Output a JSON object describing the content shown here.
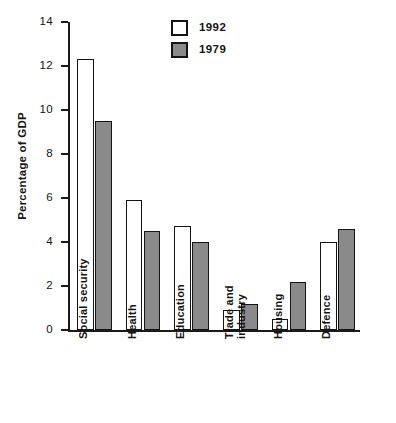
{
  "chart_data": {
    "type": "bar",
    "title": "",
    "xlabel": "",
    "ylabel": "Percentage of GDP",
    "ylim": [
      0,
      14
    ],
    "ytick_labels": [
      "0",
      "2",
      "4",
      "6",
      "8",
      "10",
      "12",
      "14"
    ],
    "ytick_values": [
      0,
      2,
      4,
      6,
      8,
      10,
      12,
      14
    ],
    "grid": false,
    "legend_position": "top-center",
    "categories": [
      "Social security",
      "Health",
      "Education",
      "Trade and industry",
      "Housing",
      "Defence"
    ],
    "category_label_lines": [
      [
        "Social security"
      ],
      [
        "Health"
      ],
      [
        "Education"
      ],
      [
        "Trade and",
        "industry"
      ],
      [
        "Housing"
      ],
      [
        "Defence"
      ]
    ],
    "series": [
      {
        "name": "1992",
        "color": "#ffffff",
        "edge_color": "#141414",
        "values": [
          12.3,
          5.9,
          4.75,
          0.9,
          0.5,
          4.0
        ]
      },
      {
        "name": "1979",
        "color": "#8a8a8a",
        "edge_color": "#141414",
        "values": [
          9.5,
          4.5,
          4.0,
          1.2,
          2.2,
          4.6
        ]
      }
    ]
  },
  "legend": {
    "items": [
      {
        "label": "1992",
        "swatch": "white-square"
      },
      {
        "label": "1979",
        "swatch": "gray-square"
      }
    ]
  },
  "axes": {
    "y_title": "Percentage of GDP",
    "y_ticks": [
      {
        "label": "14",
        "value": 14
      },
      {
        "label": "12",
        "value": 12
      },
      {
        "label": "10",
        "value": 10
      },
      {
        "label": "8",
        "value": 8
      },
      {
        "label": "6",
        "value": 6
      },
      {
        "label": "4",
        "value": 4
      },
      {
        "label": "2",
        "value": 2
      },
      {
        "label": "0",
        "value": 0
      }
    ]
  },
  "colors": {
    "ink": "#141414",
    "series_1992": "#ffffff",
    "series_1979": "#8a8a8a",
    "background": "#ffffff"
  }
}
